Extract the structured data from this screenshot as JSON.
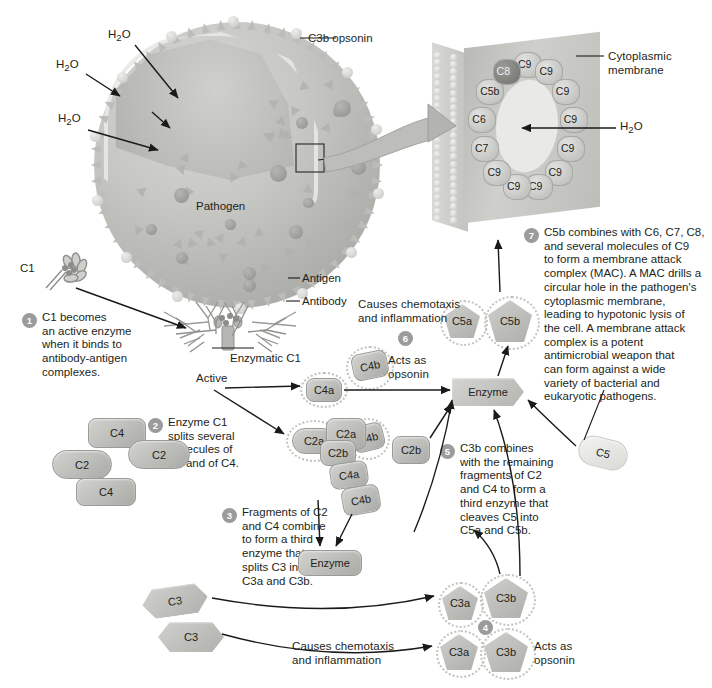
{
  "figure": {
    "domain": "biology-diagram",
    "caption": ""
  },
  "colors": {
    "ink": "#231f20",
    "protein_fill": "#c0c0bd",
    "protein_stroke": "#9a9a97",
    "step_badge": "#9b9b9b",
    "membrane": "#c3c3c0",
    "pore": "#e9e9e7",
    "page_background": "#ffffff"
  },
  "pathogen_panel": {
    "pathogen_label": "Pathogen",
    "water_labels": [
      "H2O",
      "H2O",
      "H2O"
    ],
    "water_label_html": "H<sub>2</sub>O",
    "callouts": [
      {
        "name": "c3b-opsonin",
        "text": "C3b opsonin"
      },
      {
        "name": "antigen",
        "text": "Antigen"
      },
      {
        "name": "antibody",
        "text": "Antibody"
      }
    ],
    "c1_label": "C1"
  },
  "mac_panel": {
    "membrane_label": "Cytoplasmic\nmembrane",
    "water_label": "H2O",
    "water_label_html": "H<sub>2</sub>O",
    "ring_subunits": [
      "C9",
      "C9",
      "C9",
      "C9",
      "C9",
      "C9",
      "C9",
      "C9",
      "C9",
      "C7",
      "C6",
      "C5b",
      "C8"
    ],
    "c9_count": 9,
    "terminal_components": [
      "C5b",
      "C6",
      "C7",
      "C8"
    ]
  },
  "steps": [
    {
      "number": "1",
      "text": "C1 becomes\nan active enzyme\nwhen it binds to\nantibody-antigen\ncomplexes."
    },
    {
      "number": "2",
      "text": "Enzyme C1\nsplits several\nmolecules of\nC2 and of C4."
    },
    {
      "number": "3",
      "text": "Fragments of C2\nand C4 combine\nto form a third\nenzyme that\nsplits C3 into\nC3a and C3b."
    },
    {
      "number": "4",
      "text": ""
    },
    {
      "number": "5",
      "text": "C3b combines\nwith the remaining\nfragments of C2\nand C4 to form a\nthird enzyme that\ncleaves C5 into\nC5a and C5b."
    },
    {
      "number": "6",
      "text": ""
    },
    {
      "number": "7",
      "text": "C5b combines with C6, C7, C8,\nand several molecules of C9\nto form a membrane attack\ncomplex (MAC). A MAC drills a\ncircular hole in the pathogen's\ncytoplasmic membrane,\nleading to hypotonic lysis of\nthe cell. A membrane attack\ncomplex is a potent\nantimicrobial weapon that\ncan form against a wide\nvariety of bacterial and\neukaryotic pathogens."
    }
  ],
  "inline_labels": {
    "enzymatic_c1": "Enzymatic C1",
    "active": "Active",
    "enzyme_1": "Enzyme",
    "enzyme_2": "Enzyme",
    "acts_as_opsonin_c4b": "Acts as\nopsonin",
    "acts_as_opsonin_c3b": "Acts as\nopsonin",
    "chemotaxis_c5a": "Causes chemotaxis\nand inflammation",
    "chemotaxis_c3a": "Causes chemotaxis\nand inflammation"
  },
  "molecules": [
    {
      "name": "c1-free",
      "label": "C1"
    },
    {
      "name": "c4-upper",
      "label": "C4"
    },
    {
      "name": "c2-right",
      "label": "C2"
    },
    {
      "name": "c2-left",
      "label": "C2"
    },
    {
      "name": "c4-lower",
      "label": "C4"
    },
    {
      "name": "c4a-upper",
      "label": "C4a"
    },
    {
      "name": "c4b-upper",
      "label": "C4b"
    },
    {
      "name": "c2a-left",
      "label": "C2a"
    },
    {
      "name": "c2a-mid",
      "label": "C2a"
    },
    {
      "name": "c2b-left",
      "label": "C2b"
    },
    {
      "name": "c2b-right",
      "label": "C2b"
    },
    {
      "name": "c4a-lower",
      "label": "C4a"
    },
    {
      "name": "c4b-lower",
      "label": "C4b"
    },
    {
      "name": "c4b-opsonin",
      "label": "C4b"
    },
    {
      "name": "c3-upper",
      "label": "C3"
    },
    {
      "name": "c3-lower",
      "label": "C3"
    },
    {
      "name": "c3a-upper",
      "label": "C3a"
    },
    {
      "name": "c3b-upper",
      "label": "C3b"
    },
    {
      "name": "c3a-lower",
      "label": "C3a"
    },
    {
      "name": "c3b-lower",
      "label": "C3b"
    },
    {
      "name": "c5",
      "label": "C5"
    },
    {
      "name": "c5a",
      "label": "C5a"
    },
    {
      "name": "c5b",
      "label": "C5b"
    }
  ]
}
